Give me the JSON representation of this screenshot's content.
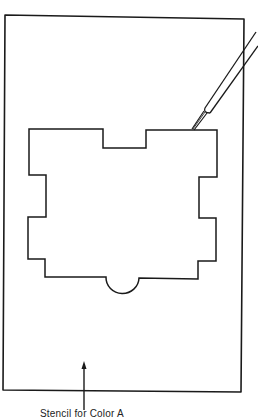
{
  "figure": {
    "caption": "Stencil for Color A",
    "stroke_color": "#1a1a1a",
    "background": "#ffffff"
  },
  "diagram": {
    "outer_sheet": {
      "label": "stencil sheet"
    },
    "cutout": {
      "label": "cut-out shape"
    },
    "tool": {
      "label": "craft knife"
    },
    "pointer": {
      "label": "arrow pointing to stencil"
    }
  }
}
